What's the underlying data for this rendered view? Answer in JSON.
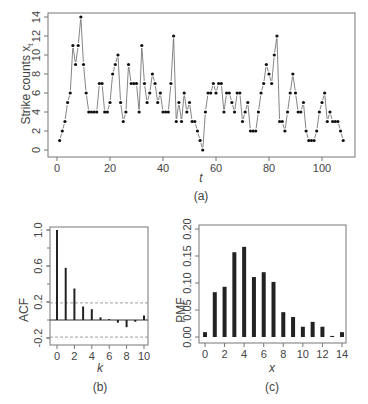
{
  "chart_data": [
    {
      "type": "line",
      "panel": "(a)",
      "title": "",
      "xlabel": "t",
      "ylabel": "Strike counts x_t",
      "xlim": [
        0,
        108
      ],
      "ylim": [
        0,
        14
      ],
      "xticks": [
        0,
        20,
        40,
        60,
        80,
        100
      ],
      "yticks": [
        0,
        2,
        4,
        6,
        8,
        10,
        12,
        14
      ],
      "grid": false,
      "markers": "filled-circle",
      "x": [
        1,
        2,
        3,
        4,
        5,
        6,
        7,
        8,
        9,
        10,
        11,
        12,
        13,
        14,
        15,
        16,
        17,
        18,
        19,
        20,
        21,
        22,
        23,
        24,
        25,
        26,
        27,
        28,
        29,
        30,
        31,
        32,
        33,
        34,
        35,
        36,
        37,
        38,
        39,
        40,
        41,
        42,
        43,
        44,
        45,
        46,
        47,
        48,
        49,
        50,
        51,
        52,
        53,
        54,
        55,
        56,
        57,
        58,
        59,
        60,
        61,
        62,
        63,
        64,
        65,
        66,
        67,
        68,
        69,
        70,
        71,
        72,
        73,
        74,
        75,
        76,
        77,
        78,
        79,
        80,
        81,
        82,
        83,
        84,
        85,
        86,
        87,
        88,
        89,
        90,
        91,
        92,
        93,
        94,
        95,
        96,
        97,
        98,
        99,
        100,
        101,
        102,
        103,
        104,
        105,
        106,
        107,
        108
      ],
      "values": [
        1,
        2,
        3,
        5,
        6,
        11,
        9,
        11,
        14,
        9,
        6,
        4,
        4,
        4,
        4,
        7,
        7,
        4,
        4,
        5,
        8,
        9,
        10,
        5,
        3,
        4,
        9,
        7,
        7,
        7,
        4,
        11,
        7,
        5,
        6,
        8,
        7,
        5,
        6,
        4,
        4,
        4,
        7,
        12,
        3,
        5,
        3,
        6,
        4,
        5,
        3,
        3,
        2,
        1,
        0,
        4,
        6,
        6,
        7,
        6,
        7,
        7,
        4,
        6,
        6,
        5,
        4,
        6,
        6,
        3,
        4,
        5,
        2,
        2,
        2,
        4,
        6,
        7,
        9,
        8,
        7,
        10,
        12,
        3,
        3,
        2,
        4,
        6,
        8,
        6,
        4,
        4,
        5,
        2,
        1,
        1,
        1,
        2,
        4,
        5,
        6,
        3,
        4,
        3,
        3,
        3,
        2,
        1
      ],
      "caption": "(a)"
    },
    {
      "type": "bar",
      "panel": "(b)",
      "xlabel": "k",
      "ylabel": "ACF",
      "categories": [
        0,
        1,
        2,
        3,
        4,
        5,
        6,
        7,
        8,
        9,
        10
      ],
      "values": [
        1.0,
        0.58,
        0.35,
        0.15,
        0.12,
        0.03,
        0.01,
        -0.03,
        -0.08,
        -0.02,
        0.05
      ],
      "confidence_band": [
        -0.19,
        0.19
      ],
      "xticks": [
        0,
        2,
        4,
        6,
        8,
        10
      ],
      "yticks": [
        -0.2,
        0.2,
        0.6,
        1.0
      ],
      "ylim": [
        -0.25,
        1.05
      ],
      "caption": "(b)"
    },
    {
      "type": "bar",
      "panel": "(c)",
      "xlabel": "x",
      "ylabel": "PMF",
      "categories": [
        0,
        1,
        2,
        3,
        4,
        5,
        6,
        7,
        8,
        9,
        10,
        11,
        12,
        13,
        14
      ],
      "values": [
        0.009,
        0.083,
        0.093,
        0.157,
        0.167,
        0.111,
        0.12,
        0.102,
        0.046,
        0.037,
        0.019,
        0.028,
        0.019,
        0.002,
        0.009
      ],
      "xticks": [
        0,
        2,
        4,
        6,
        8,
        10,
        12,
        14
      ],
      "yticks": [
        0.0,
        0.05,
        0.1,
        0.15,
        0.2
      ],
      "ylim": [
        0,
        0.2
      ],
      "caption": "(c)"
    }
  ],
  "labels": {
    "a_ylabel": "Strike counts",
    "a_ylabel_sub": "t",
    "a_ylabel_var": "x",
    "a_xlabel": "t",
    "a_caption": "(a)",
    "b_ylabel": "ACF",
    "b_xlabel": "k",
    "b_caption": "(b)",
    "c_ylabel": "PMF",
    "c_xlabel": "x",
    "c_caption": "(c)"
  }
}
